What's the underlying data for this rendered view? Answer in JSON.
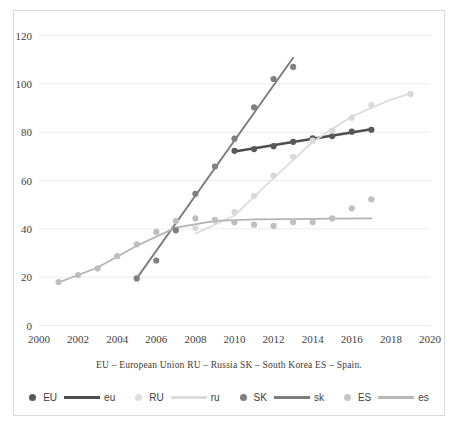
{
  "chart_data": {
    "type": "scatter",
    "title": "",
    "subtitle": "",
    "xlabel": "",
    "ylabel": "",
    "xlim": [
      2000,
      2020
    ],
    "ylim": [
      0,
      120
    ],
    "xticks": [
      2000,
      2002,
      2004,
      2006,
      2008,
      2010,
      2012,
      2014,
      2016,
      2018,
      2020
    ],
    "yticks": [
      0,
      20,
      40,
      60,
      80,
      100,
      120
    ],
    "grid": "horizontal",
    "legend_position": "bottom",
    "caption": "EU – European Union  RU – Russia  SK – South Korea  ES – Spain.",
    "series": [
      {
        "name": "EU",
        "trend_name": "eu",
        "color": "#595959",
        "trend_color": "#4d4d4d",
        "marker": "circle",
        "points": [
          {
            "x": 2010,
            "y": 72.3
          },
          {
            "x": 2011,
            "y": 73.0
          },
          {
            "x": 2012,
            "y": 74.2
          },
          {
            "x": 2013,
            "y": 76.0
          },
          {
            "x": 2014,
            "y": 77.4
          },
          {
            "x": 2015,
            "y": 78.4
          },
          {
            "x": 2016,
            "y": 80.2
          },
          {
            "x": 2017,
            "y": 81.0
          }
        ],
        "trend": [
          {
            "x": 2010,
            "y": 72.0
          },
          {
            "x": 2017,
            "y": 81.2
          }
        ]
      },
      {
        "name": "RU",
        "trend_name": "ru",
        "color": "#d9d9d9",
        "trend_color": "#dcdcdc",
        "marker": "circle",
        "points": [
          {
            "x": 2008,
            "y": 40.3
          },
          {
            "x": 2009,
            "y": 43.6
          },
          {
            "x": 2010,
            "y": 47.0
          },
          {
            "x": 2011,
            "y": 53.6
          },
          {
            "x": 2012,
            "y": 62.0
          },
          {
            "x": 2013,
            "y": 69.8
          },
          {
            "x": 2014,
            "y": 76.5
          },
          {
            "x": 2015,
            "y": 80.6
          },
          {
            "x": 2016,
            "y": 86.0
          },
          {
            "x": 2017,
            "y": 91.2
          },
          {
            "x": 2019,
            "y": 95.8
          }
        ],
        "trend": [
          {
            "x": 2008,
            "y": 38.0
          },
          {
            "x": 2010,
            "y": 45.5
          },
          {
            "x": 2012,
            "y": 61.0
          },
          {
            "x": 2014,
            "y": 76.0
          },
          {
            "x": 2016,
            "y": 86.5
          },
          {
            "x": 2018,
            "y": 93.5
          },
          {
            "x": 2019,
            "y": 96.0
          }
        ]
      },
      {
        "name": "SK",
        "trend_name": "sk",
        "color": "#808080",
        "trend_color": "#7d7d7d",
        "marker": "circle",
        "points": [
          {
            "x": 2005,
            "y": 19.5
          },
          {
            "x": 2006,
            "y": 26.9
          },
          {
            "x": 2007,
            "y": 39.4
          },
          {
            "x": 2008,
            "y": 54.5
          },
          {
            "x": 2009,
            "y": 65.8
          },
          {
            "x": 2010,
            "y": 77.3
          },
          {
            "x": 2011,
            "y": 90.3
          },
          {
            "x": 2012,
            "y": 102.0
          },
          {
            "x": 2013,
            "y": 107.0
          }
        ],
        "trend": [
          {
            "x": 2005,
            "y": 19.5
          },
          {
            "x": 2013,
            "y": 110.8
          }
        ]
      },
      {
        "name": "ES",
        "trend_name": "es",
        "color": "#bfbfbf",
        "trend_color": "#b3b3b3",
        "marker": "circle",
        "points": [
          {
            "x": 2001,
            "y": 18.0
          },
          {
            "x": 2002,
            "y": 20.9
          },
          {
            "x": 2003,
            "y": 23.6
          },
          {
            "x": 2004,
            "y": 28.7
          },
          {
            "x": 2005,
            "y": 33.6
          },
          {
            "x": 2006,
            "y": 38.7
          },
          {
            "x": 2007,
            "y": 43.2
          },
          {
            "x": 2008,
            "y": 44.3
          },
          {
            "x": 2009,
            "y": 43.6
          },
          {
            "x": 2010,
            "y": 42.7
          },
          {
            "x": 2011,
            "y": 41.7
          },
          {
            "x": 2012,
            "y": 41.2
          },
          {
            "x": 2013,
            "y": 42.8
          },
          {
            "x": 2014,
            "y": 42.8
          },
          {
            "x": 2015,
            "y": 44.3
          },
          {
            "x": 2016,
            "y": 48.5
          },
          {
            "x": 2017,
            "y": 52.2
          }
        ],
        "trend": [
          {
            "x": 2001,
            "y": 17.8
          },
          {
            "x": 2003,
            "y": 24.0
          },
          {
            "x": 2005,
            "y": 33.0
          },
          {
            "x": 2007,
            "y": 40.5
          },
          {
            "x": 2009,
            "y": 43.3
          },
          {
            "x": 2011,
            "y": 43.9
          },
          {
            "x": 2013,
            "y": 44.0
          },
          {
            "x": 2015,
            "y": 44.2
          },
          {
            "x": 2017,
            "y": 44.3
          }
        ]
      }
    ]
  },
  "axis": {
    "y_tick_labels": [
      "120",
      "100",
      "80",
      "60",
      "40",
      "20",
      "0"
    ],
    "x_tick_labels": [
      "2000",
      "2002",
      "2004",
      "2006",
      "2008",
      "2010",
      "2012",
      "2014",
      "2016",
      "2018",
      "2020"
    ]
  },
  "caption": {
    "text": "EU – European Union  RU – Russia  SK – South Korea  ES – Spain."
  },
  "legend": {
    "entries": [
      {
        "marker_label": "EU",
        "line_label": "eu",
        "marker_color": "#595959",
        "line_color": "#4d4d4d"
      },
      {
        "marker_label": "RU",
        "line_label": "ru",
        "marker_color": "#dedede",
        "line_color": "#dcdcdc"
      },
      {
        "marker_label": "SK",
        "line_label": "sk",
        "marker_color": "#808080",
        "line_color": "#7d7d7d"
      },
      {
        "marker_label": "ES",
        "line_label": "es",
        "marker_color": "#c6c6c6",
        "line_color": "#b9b9b9"
      }
    ]
  },
  "style": {
    "plot_border_color": "#d9d9d9",
    "grid_color": "#ececec",
    "text_color": "#3f3f3f",
    "background": "#ffffff"
  }
}
